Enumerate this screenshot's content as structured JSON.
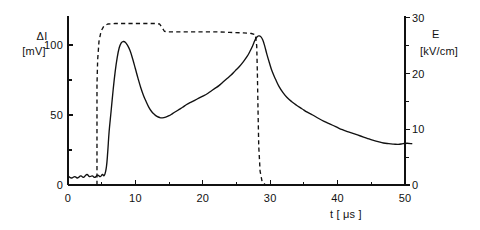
{
  "chart_data": {
    "type": "line",
    "title": "",
    "xlabel": "t [ μs ]",
    "ylabel_left": "ΔI\n[mV]",
    "ylabel_right": "E\n[kV/cm]",
    "xlim": [
      0,
      51.5
    ],
    "ylim_left": [
      0,
      122
    ],
    "ylim_right": [
      0,
      31
    ],
    "grid": false,
    "legend": "none",
    "x_ticks_major": [
      0,
      10,
      20,
      30,
      40,
      50
    ],
    "x_ticks_minor": [
      5,
      15,
      25,
      35,
      45
    ],
    "x_tick_labels": [
      "0",
      "10",
      "20",
      "30",
      "40",
      "50"
    ],
    "y_ticks_left_major": [
      0,
      50,
      100
    ],
    "y_ticks_left_minor": [
      25,
      75
    ],
    "y_tick_labels_left": [
      "0",
      "50",
      "100"
    ],
    "y_ticks_right_major": [
      0,
      10,
      20,
      30
    ],
    "y_ticks_right_minor": [
      5,
      15,
      25
    ],
    "y_tick_labels_right": [
      "0",
      "10",
      "20",
      "30"
    ],
    "series": [
      {
        "name": "ΔI",
        "axis": "left",
        "style": "solid",
        "points": [
          [
            0.0,
            6.5
          ],
          [
            0.5,
            5.0
          ],
          [
            1.0,
            6.0
          ],
          [
            1.4,
            5.0
          ],
          [
            1.9,
            6.5
          ],
          [
            2.3,
            5.5
          ],
          [
            2.8,
            7.5
          ],
          [
            3.2,
            6.0
          ],
          [
            3.6,
            6.5
          ],
          [
            4.0,
            5.5
          ],
          [
            4.4,
            7.0
          ],
          [
            4.8,
            6.0
          ],
          [
            5.1,
            7.5
          ],
          [
            5.4,
            7.0
          ],
          [
            5.7,
            13.0
          ],
          [
            5.9,
            24.0
          ],
          [
            6.1,
            38.0
          ],
          [
            6.4,
            53.0
          ],
          [
            6.7,
            68.0
          ],
          [
            7.0,
            81.0
          ],
          [
            7.3,
            91.0
          ],
          [
            7.6,
            98.0
          ],
          [
            7.9,
            101.5
          ],
          [
            8.2,
            102.5
          ],
          [
            8.5,
            102.0
          ],
          [
            8.8,
            100.0
          ],
          [
            9.2,
            96.0
          ],
          [
            9.6,
            90.0
          ],
          [
            10.0,
            83.0
          ],
          [
            10.4,
            76.0
          ],
          [
            10.8,
            69.5
          ],
          [
            11.2,
            64.0
          ],
          [
            11.6,
            59.5
          ],
          [
            12.0,
            55.5
          ],
          [
            12.4,
            52.5
          ],
          [
            12.8,
            50.5
          ],
          [
            13.2,
            49.0
          ],
          [
            13.6,
            48.2
          ],
          [
            14.0,
            48.0
          ],
          [
            14.5,
            48.5
          ],
          [
            15.0,
            49.5
          ],
          [
            15.5,
            51.0
          ],
          [
            16.0,
            52.5
          ],
          [
            16.5,
            54.0
          ],
          [
            17.0,
            55.5
          ],
          [
            17.6,
            57.5
          ],
          [
            18.2,
            59.0
          ],
          [
            18.8,
            60.5
          ],
          [
            19.4,
            62.0
          ],
          [
            20.0,
            63.5
          ],
          [
            20.6,
            65.0
          ],
          [
            21.2,
            67.0
          ],
          [
            21.8,
            69.0
          ],
          [
            22.4,
            71.0
          ],
          [
            23.0,
            73.5
          ],
          [
            23.6,
            76.0
          ],
          [
            24.2,
            78.5
          ],
          [
            24.8,
            81.5
          ],
          [
            25.4,
            84.5
          ],
          [
            26.0,
            88.0
          ],
          [
            26.6,
            92.0
          ],
          [
            27.0,
            95.5
          ],
          [
            27.4,
            99.5
          ],
          [
            27.7,
            103.0
          ],
          [
            28.0,
            105.5
          ],
          [
            28.3,
            106.5
          ],
          [
            28.6,
            106.0
          ],
          [
            28.9,
            103.5
          ],
          [
            29.2,
            99.0
          ],
          [
            29.5,
            93.5
          ],
          [
            29.9,
            87.0
          ],
          [
            30.3,
            81.0
          ],
          [
            30.8,
            75.5
          ],
          [
            31.3,
            70.5
          ],
          [
            31.9,
            66.0
          ],
          [
            32.5,
            62.5
          ],
          [
            33.2,
            59.5
          ],
          [
            33.9,
            57.0
          ],
          [
            34.7,
            54.5
          ],
          [
            35.5,
            52.0
          ],
          [
            36.3,
            50.0
          ],
          [
            37.2,
            47.5
          ],
          [
            38.0,
            45.5
          ],
          [
            38.9,
            43.5
          ],
          [
            39.8,
            41.5
          ],
          [
            40.7,
            39.5
          ],
          [
            41.6,
            38.0
          ],
          [
            42.5,
            36.5
          ],
          [
            43.4,
            35.0
          ],
          [
            44.3,
            33.5
          ],
          [
            45.2,
            32.0
          ],
          [
            46.0,
            31.0
          ],
          [
            46.8,
            30.0
          ],
          [
            47.6,
            29.5
          ],
          [
            48.3,
            29.2
          ],
          [
            49.0,
            29.0
          ],
          [
            49.7,
            29.5
          ],
          [
            50.3,
            29.8
          ],
          [
            51.0,
            29.5
          ]
        ]
      },
      {
        "name": "E",
        "axis": "right",
        "style": "dashed",
        "points": [
          [
            4.3,
            0.0
          ],
          [
            4.3,
            18.0
          ],
          [
            4.4,
            22.5
          ],
          [
            4.6,
            25.8
          ],
          [
            4.9,
            27.6
          ],
          [
            5.3,
            28.5
          ],
          [
            5.9,
            28.9
          ],
          [
            7.0,
            29.0
          ],
          [
            9.0,
            29.0
          ],
          [
            11.0,
            29.0
          ],
          [
            13.0,
            29.0
          ],
          [
            13.6,
            28.9
          ],
          [
            14.0,
            28.2
          ],
          [
            14.3,
            27.6
          ],
          [
            14.8,
            27.5
          ],
          [
            16.0,
            27.5
          ],
          [
            18.0,
            27.5
          ],
          [
            20.0,
            27.5
          ],
          [
            22.0,
            27.5
          ],
          [
            24.0,
            27.4
          ],
          [
            26.0,
            27.3
          ],
          [
            27.2,
            27.2
          ],
          [
            27.8,
            27.0
          ],
          [
            28.0,
            25.0
          ],
          [
            28.1,
            20.0
          ],
          [
            28.2,
            13.0
          ],
          [
            28.3,
            7.0
          ],
          [
            28.5,
            2.5
          ],
          [
            28.8,
            0.6
          ],
          [
            29.3,
            0.0
          ]
        ]
      }
    ],
    "axis_labels": {
      "left_symbol": "ΔI",
      "left_unit": "[mV]",
      "right_symbol": "E",
      "right_unit": "[kV/cm]",
      "x_axis": "t [ μs ]"
    }
  }
}
